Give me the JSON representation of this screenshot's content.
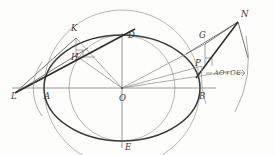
{
  "figure": {
    "kind": "geometric-construction",
    "background_color": "#fdfdfc",
    "ink_color": "#55544f",
    "ink_color_light": "#8d8c86",
    "ink_color_dark": "#2f2e2b",
    "labels": [
      {
        "id": "L",
        "text": "L",
        "x": 11,
        "y": 99
      },
      {
        "id": "A",
        "text": "A",
        "x": 44,
        "y": 99
      },
      {
        "id": "O",
        "text": "O",
        "x": 119,
        "y": 101
      },
      {
        "id": "B",
        "text": "B",
        "x": 199,
        "y": 99
      },
      {
        "id": "D",
        "text": "D",
        "x": 128,
        "y": 38
      },
      {
        "id": "E",
        "text": "E",
        "x": 125,
        "y": 150
      },
      {
        "id": "K",
        "text": "K",
        "x": 71,
        "y": 31
      },
      {
        "id": "H",
        "text": "H",
        "x": 71,
        "y": 60
      },
      {
        "id": "G",
        "text": "G",
        "x": 199,
        "y": 38
      },
      {
        "id": "P",
        "text": "P",
        "x": 195,
        "y": 66
      },
      {
        "id": "N",
        "text": "N",
        "x": 241,
        "y": 17
      }
    ],
    "annotation": {
      "text": "AO+OE",
      "x": 214,
      "y": 75
    },
    "points": {
      "O": {
        "x": 122,
        "y": 88
      },
      "A": {
        "x": 46,
        "y": 88
      },
      "B": {
        "x": 199,
        "y": 88
      },
      "D": {
        "x": 122,
        "y": 45
      },
      "E": {
        "x": 122,
        "y": 141
      },
      "L": {
        "x": 15,
        "y": 93
      },
      "K": {
        "x": 76,
        "y": 38
      },
      "H": {
        "x": 78,
        "y": 57
      },
      "G": {
        "x": 205,
        "y": 44
      },
      "P": {
        "x": 202,
        "y": 66
      },
      "N": {
        "x": 238,
        "y": 22
      }
    },
    "curves": {
      "ellipse_major": {
        "cx": 122,
        "cy": 88,
        "rx": 78,
        "ry": 53
      },
      "circle_major": {
        "cx": 122,
        "cy": 88,
        "r": 78
      },
      "circle_minor": {
        "cx": 122,
        "cy": 88,
        "r": 53
      },
      "arc_right_radius": 113
    }
  }
}
